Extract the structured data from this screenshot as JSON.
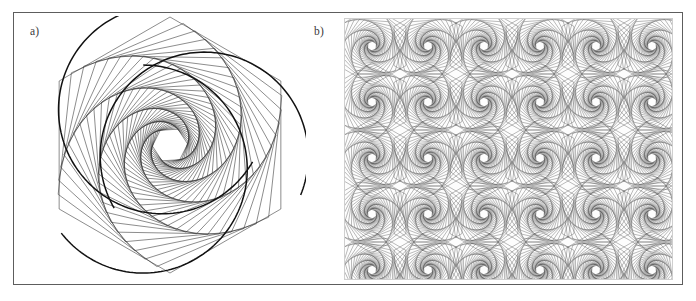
{
  "figure": {
    "background_color": "#ffffff",
    "frame_color": "#5d5d5d",
    "panels": [
      {
        "id": "a",
        "label": "a)",
        "kind": "single-motif",
        "description": "nested rotating hexagon spiral with circular arc envelope"
      },
      {
        "id": "b",
        "label": "b)",
        "kind": "tiled-pattern",
        "description": "periodic tiling of the spiral motif"
      }
    ]
  },
  "chart_data": {
    "type": "line",
    "title": "",
    "subtitle": "",
    "xlabel": "",
    "ylabel": "",
    "grid": false,
    "legend_position": "none",
    "panels": [
      {
        "id": "a",
        "label": "a)",
        "motif": "hexagon-whirl",
        "polygon_sides": 6,
        "iterations": 44,
        "shrink_ratio": 0.955,
        "rotation_step_deg": 6.2,
        "start_rotation_deg": 0,
        "outer_radius_px": 128,
        "center_x_px": 136,
        "center_y_px": 129,
        "stroke_color": "#2e2e2e",
        "stroke_width": 0.55,
        "arc_overlays": {
          "count": 3,
          "stroke_color": "#111111",
          "stroke_width": 1.5,
          "radius_px": 104,
          "offset_px": 36,
          "arc_span_deg": 232
        }
      },
      {
        "id": "b",
        "label": "b)",
        "motif": "hexagon-whirl-tiled",
        "tile_size_px": 56,
        "tiles_x": 6,
        "tiles_y": 5,
        "polygon_sides": 6,
        "iterations": 30,
        "shrink_ratio": 0.93,
        "rotation_step_deg": 8.5,
        "mirror_symmetry": true,
        "stroke_color": "#3a3a3a",
        "stroke_width": 0.35,
        "background_color": "#fdfdfd"
      }
    ],
    "axis_ranges": {
      "x": [
        0,
        696
      ],
      "y": [
        0,
        301
      ]
    },
    "tick_labels": {
      "x": [],
      "y": []
    },
    "annotations": [
      "a)",
      "b)"
    ]
  }
}
